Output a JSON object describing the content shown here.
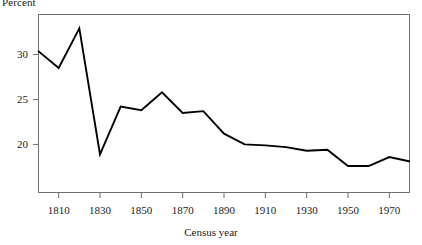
{
  "chart_data": {
    "type": "line",
    "title": "",
    "xlabel": "Census year",
    "ylabel": "Percent",
    "x": [
      1800,
      1810,
      1820,
      1830,
      1840,
      1850,
      1860,
      1870,
      1880,
      1890,
      1900,
      1910,
      1920,
      1930,
      1940,
      1950,
      1960,
      1970,
      1980
    ],
    "values": [
      30.4,
      28.5,
      32.9,
      18.9,
      24.2,
      23.8,
      25.8,
      23.5,
      23.7,
      21.2,
      20.0,
      19.9,
      19.7,
      19.3,
      19.4,
      17.6,
      17.6,
      18.6,
      18.1
    ],
    "series": [
      {
        "name": "Percent",
        "values": [
          30.4,
          28.5,
          32.9,
          18.9,
          24.2,
          23.8,
          25.8,
          23.5,
          23.7,
          21.2,
          20.0,
          19.9,
          19.7,
          19.3,
          19.4,
          17.6,
          17.6,
          18.6,
          18.1
        ]
      }
    ],
    "xlim": [
      1800,
      1980
    ],
    "ylim": [
      14.6,
      34.5
    ],
    "yticks": [
      20,
      25,
      30
    ],
    "ytick_labels": [
      "20",
      "25",
      "30"
    ],
    "xticks": [
      1810,
      1830,
      1850,
      1870,
      1890,
      1910,
      1930,
      1950,
      1970
    ],
    "xtick_labels": [
      "1810",
      "1830",
      "1850",
      "1870",
      "1890",
      "1910",
      "1930",
      "1950",
      "1970"
    ],
    "grid": false,
    "legend": "none",
    "line_color": "#000000",
    "frame_color": "#6f6f6f"
  }
}
